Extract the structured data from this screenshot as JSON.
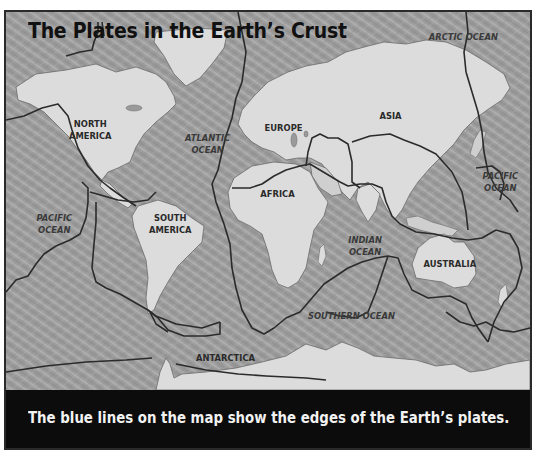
{
  "map": {
    "title": "The Plates in the Earth’s Crust",
    "caption": "The blue lines on the map show the edges of the Earth’s plates.",
    "colors": {
      "ocean": "#9a9a9a",
      "land": "#dcdcdc",
      "plate_boundary": "#2b2b2b",
      "frame_border": "#2a2a2a",
      "caption_bar": "#0c0c0c",
      "caption_text": "#f2f2f2"
    },
    "continent_labels": [
      {
        "id": "north-america",
        "text": "NORTH\nAMERICA"
      },
      {
        "id": "south-america",
        "text": "SOUTH\nAMERICA"
      },
      {
        "id": "europe",
        "text": "EUROPE"
      },
      {
        "id": "asia",
        "text": "ASIA"
      },
      {
        "id": "africa",
        "text": "AFRICA"
      },
      {
        "id": "australia",
        "text": "AUSTRALIA"
      },
      {
        "id": "antarctica",
        "text": "ANTARCTICA"
      }
    ],
    "ocean_labels": [
      {
        "id": "arctic-ocean",
        "text": "ARCTIC OCEAN"
      },
      {
        "id": "atlantic-ocean",
        "text": "ATLANTIC\nOCEAN"
      },
      {
        "id": "pacific-ocean-west",
        "text": "PACIFIC\nOCEAN"
      },
      {
        "id": "pacific-ocean-east",
        "text": "PACIFIC\nOCEAN"
      },
      {
        "id": "indian-ocean",
        "text": "INDIAN\nOCEAN"
      },
      {
        "id": "southern-ocean",
        "text": "SOUTHERN OCEAN"
      }
    ]
  }
}
